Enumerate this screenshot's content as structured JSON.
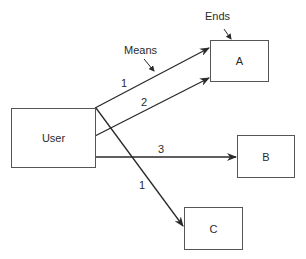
{
  "diagram": {
    "nodes": {
      "user": {
        "label": "User"
      },
      "a": {
        "label": "A"
      },
      "b": {
        "label": "B"
      },
      "c": {
        "label": "C"
      }
    },
    "annotations": {
      "ends": "Ends",
      "means": "Means"
    },
    "edges": [
      {
        "from": "User",
        "to": "A",
        "label": "1"
      },
      {
        "from": "User",
        "to": "A",
        "label": "2"
      },
      {
        "from": "User",
        "to": "B",
        "label": "3"
      },
      {
        "from": "User",
        "to": "C",
        "label": "1"
      }
    ],
    "colors": {
      "line": "#2a2a2a",
      "box_border": "#555555"
    }
  }
}
